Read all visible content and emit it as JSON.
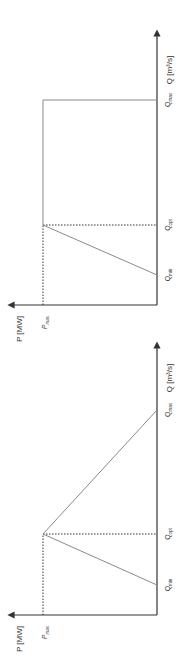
{
  "diagram": {
    "orientation": "rotated 90 degrees clockwise",
    "colors": {
      "axis": "#333333",
      "curve": "#8a8a8a",
      "dotted": "#333333",
      "text": "#333333"
    },
    "charts": [
      {
        "id": "top",
        "description": "Power rises from Q_min to P_max at Q_opt, then constant P_max up to Q_max",
        "y_axis_label": "P [MW]",
        "x_axis_label": "Q [m³/s]",
        "p_level_label": "P",
        "p_level_sub": "max",
        "ticks": [
          {
            "label": "Q",
            "sub": "min"
          },
          {
            "label": "Q",
            "sub": "opt"
          },
          {
            "label": "Q",
            "sub": "max"
          }
        ]
      },
      {
        "id": "bottom",
        "description": "Power rises from Q_min to P_max at Q_opt, then falls linearly to 0 at Q_max",
        "y_axis_label": "P [MW]",
        "x_axis_label": "Q [m³/s]",
        "p_level_label": "P",
        "p_level_sub": "max",
        "ticks": [
          {
            "label": "Q",
            "sub": "min"
          },
          {
            "label": "Q",
            "sub": "opt"
          },
          {
            "label": "Q",
            "sub": "max"
          }
        ]
      }
    ]
  }
}
